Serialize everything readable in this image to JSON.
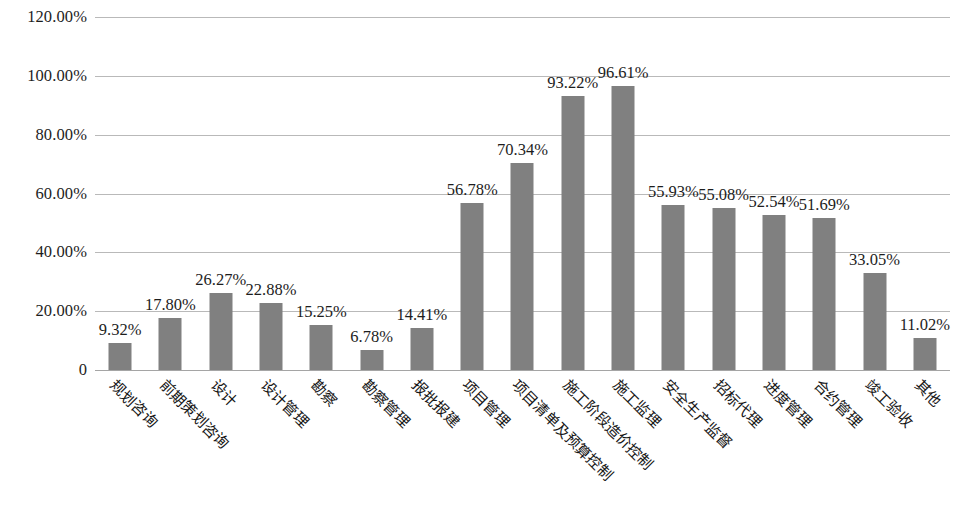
{
  "chart_data": {
    "type": "bar",
    "title": "",
    "subtitle": "",
    "xlabel": "",
    "ylabel": "",
    "ylim": [
      0,
      1.2
    ],
    "grid": true,
    "legend": false,
    "legend_position": "none",
    "bar_color": "#808080",
    "gridline_color": "#b9b9b9",
    "categories": [
      "规划咨询",
      "前期策划咨询",
      "设计",
      "设计管理",
      "勘察",
      "勘察管理",
      "报批报建",
      "项目管理",
      "项目清单及预算控制",
      "施工阶段造价控制",
      "施工监理",
      "安全生产监督",
      "招标代理",
      "进度管理",
      "合约管理",
      "竣工验收",
      "其他"
    ],
    "values": [
      9.32,
      17.8,
      26.27,
      22.88,
      15.25,
      6.78,
      14.41,
      56.78,
      70.34,
      93.22,
      96.61,
      55.93,
      55.08,
      52.54,
      51.69,
      33.05,
      11.02
    ],
    "value_labels": [
      "9.32%",
      "17.80%",
      "26.27%",
      "22.88%",
      "15.25%",
      "6.78%",
      "14.41%",
      "56.78%",
      "70.34%",
      "93.22%",
      "96.61%",
      "55.93%",
      "55.08%",
      "52.54%",
      "51.69%",
      "33.05%",
      "11.02%"
    ],
    "y_ticks": [
      0,
      20,
      40,
      60,
      80,
      100,
      120
    ],
    "y_tick_labels": [
      "0",
      "20.00%",
      "40.00%",
      "60.00%",
      "80.00%",
      "100.00%",
      "120.00%"
    ]
  }
}
